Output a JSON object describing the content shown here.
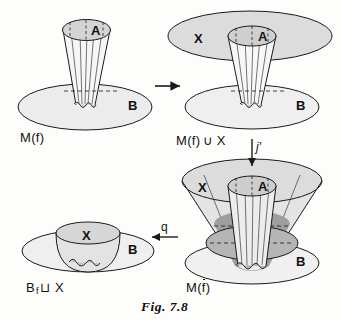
{
  "figure": {
    "caption": "Fig. 7.8",
    "background": "#fdfdfb",
    "ink": "#1a1a1a",
    "fill_light": "#ececec",
    "fill_mid": "#d9d9d9",
    "fill_dark": "#b8b8b8"
  },
  "panels": {
    "top_left": {
      "name": "M(f)",
      "label": "M(f)",
      "set_top": "A",
      "set_base": "B"
    },
    "top_right": {
      "name": "M(f) union X",
      "label_prefix": "M(f)",
      "label_union": "∪",
      "label_suffix": "X",
      "label": "M(f) ∪ X",
      "set_top": "A",
      "set_outer": "X",
      "set_base": "B"
    },
    "bottom_right": {
      "name": "M(f bar)",
      "label_prefix": "M(",
      "label_fbar": "f",
      "label_suffix": ")",
      "label": "M(f̄)",
      "set_top": "A",
      "set_outer": "X",
      "set_base": "B"
    },
    "bottom_left": {
      "name": "B f-sqcup X",
      "label_b": "B",
      "label_sub": "f",
      "label_sqcup": "⊔",
      "label_x": "X",
      "label": "B f⊔ X",
      "set_bowl": "X",
      "set_base": "B"
    }
  },
  "arrows": {
    "right": {
      "label": "",
      "direction": "right"
    },
    "down": {
      "label": "j′",
      "direction": "down"
    },
    "left": {
      "label": "q",
      "direction": "left"
    }
  }
}
